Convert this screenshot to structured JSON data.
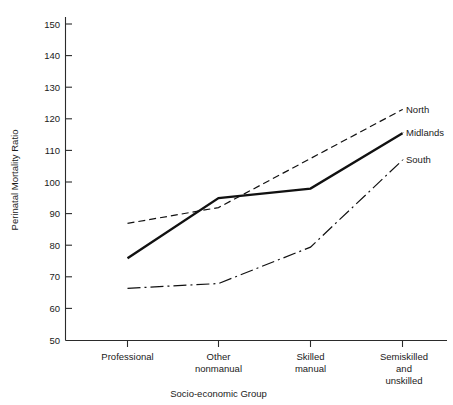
{
  "chart_data": {
    "type": "line",
    "title": "",
    "xlabel": "Socio-economic Group",
    "ylabel": "Perinatal Mortality Ratio",
    "categories": [
      "Professional",
      "Other nonmanual",
      "Skilled manual",
      "Semiskilled and unskilled"
    ],
    "category_lines": [
      [
        "Professional"
      ],
      [
        "Other",
        "nonmanual"
      ],
      [
        "Skilled",
        "manual"
      ],
      [
        "Semiskilled",
        "and",
        "unskilled"
      ]
    ],
    "ylim": [
      50,
      150
    ],
    "yticks": [
      50,
      60,
      70,
      80,
      90,
      100,
      110,
      120,
      130,
      140,
      150
    ],
    "ytick_labels": [
      "50",
      "60",
      "70",
      "80",
      "90",
      "100",
      "110",
      "120",
      "130",
      "140",
      "150"
    ],
    "grid": false,
    "legend_position": "right-inline-labels",
    "series": [
      {
        "name": "North",
        "label": "North",
        "style": "dashed",
        "color": "#111111",
        "values": [
          87,
          92,
          107.5,
          123
        ]
      },
      {
        "name": "Midlands",
        "label": "Midlands",
        "style": "solid",
        "color": "#111111",
        "values": [
          76,
          95,
          98,
          115.5
        ]
      },
      {
        "name": "South",
        "label": "South",
        "style": "dash-dot",
        "color": "#111111",
        "values": [
          66.5,
          68,
          79.5,
          107
        ]
      }
    ]
  },
  "axis": {
    "ylabel": "Perinatal Mortality Ratio",
    "xlabel": "Socio-economic Group"
  },
  "series_labels": {
    "north": "North",
    "midlands": "Midlands",
    "south": "South"
  },
  "ytick_labels": {
    "t0": "50",
    "t1": "60",
    "t2": "70",
    "t3": "80",
    "t4": "90",
    "t5": "100",
    "t6": "110",
    "t7": "120",
    "t8": "130",
    "t9": "140",
    "t10": "150"
  },
  "xtick_labels": {
    "c0l0": "Professional",
    "c1l0": "Other",
    "c1l1": "nonmanual",
    "c2l0": "Skilled",
    "c2l1": "manual",
    "c3l0": "Semiskilled",
    "c3l1": "and",
    "c3l2": "unskilled"
  }
}
